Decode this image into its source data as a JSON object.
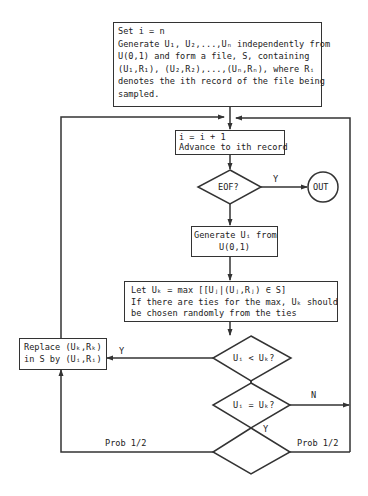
{
  "diagram": {
    "type": "flowchart",
    "nodes": {
      "init": {
        "shape": "rectangle",
        "lines": [
          "Set i = n",
          "Generate U₁, U₂,...,Uₙ independently from",
          "U(0,1) and form a file, S, containing",
          "(U₁,R₁), (U₂,R₂),...,(Uₙ,Rₙ), where Rᵢ",
          "denotes the ith record of the file being",
          "sampled."
        ]
      },
      "advance": {
        "shape": "rectangle",
        "lines": [
          "i = i + 1",
          "Advance to ith record"
        ]
      },
      "eof": {
        "shape": "diamond",
        "label": "EOF?"
      },
      "out": {
        "shape": "circle",
        "label": "OUT"
      },
      "generate": {
        "shape": "rectangle",
        "lines": [
          "Generate Uᵢ from",
          "U(0,1)"
        ]
      },
      "let_max": {
        "shape": "rectangle",
        "lines": [
          "Let Uₖ = max [[Uⱼ|(Uⱼ,Rⱼ) ∈ S]",
          "If there are ties for the max, Uₖ should",
          "be chosen randomly from the ties"
        ]
      },
      "replace": {
        "shape": "rectangle",
        "lines": [
          "Replace (Uₖ,Rₖ)",
          "in S by (Uᵢ,Rᵢ)"
        ]
      },
      "less": {
        "shape": "diamond",
        "label": "Uᵢ < Uₖ?"
      },
      "equal": {
        "shape": "diamond",
        "label": "Uᵢ = Uₖ?"
      },
      "coin": {
        "shape": "diamond",
        "label": ""
      }
    },
    "edge_labels": {
      "eof_yes": "Y",
      "less_yes": "Y",
      "equal_no": "N",
      "equal_yes": "Y",
      "coin_left": "Prob 1/2",
      "coin_right": "Prob 1/2"
    },
    "line_color": "#333333"
  }
}
